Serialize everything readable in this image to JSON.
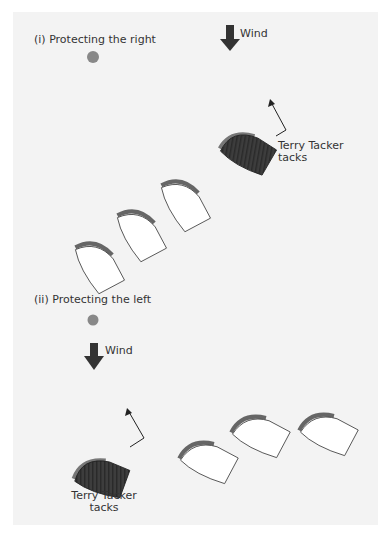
{
  "panel_i": {
    "title": "(i)  Protecting the right",
    "wind_label": "Wind",
    "tacker_label_line1": "Terry Tacker",
    "tacker_label_line2": "tacks"
  },
  "panel_ii": {
    "title": "(ii) Protecting the left",
    "wind_label": "Wind",
    "tacker_label_line1": "Terry Tacker",
    "tacker_label_line2": "tacks"
  },
  "colors": {
    "background": "#f3f3f3",
    "mark": "#888888",
    "wind_arrow": "#333333",
    "tacker_hull": "#3a3a3a",
    "boat_hull": "#ffffff",
    "boat_shadow": "#666666"
  }
}
